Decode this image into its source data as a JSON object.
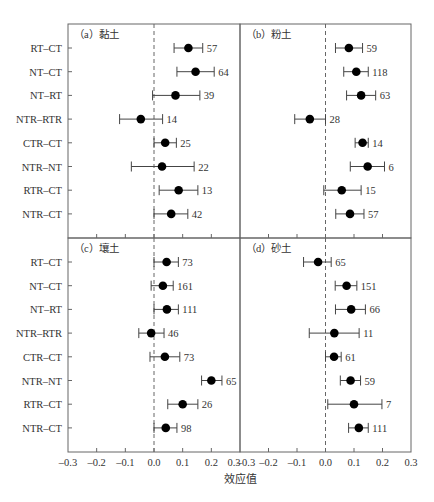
{
  "chart_data": {
    "type": "forest",
    "xlabel": "效应值",
    "xlim": [
      -0.3,
      0.3
    ],
    "xticks": [
      "-0.3",
      "-0.2",
      "-0.1",
      "0.0",
      "0.1",
      "0.2",
      "0.3"
    ],
    "reference_line": 0.0,
    "categories": [
      "RT-CT",
      "NT-CT",
      "NT-RT",
      "NTR-RTR",
      "CTR-CT",
      "NTR-NT",
      "RTR-CT",
      "NTR-CT"
    ],
    "panels": [
      {
        "id": "a",
        "title": "（a）黏土",
        "points": [
          {
            "label": "RT-CT",
            "mean": 0.12,
            "lo": 0.07,
            "hi": 0.17,
            "n": "57"
          },
          {
            "label": "NT-CT",
            "mean": 0.145,
            "lo": 0.08,
            "hi": 0.21,
            "n": "64"
          },
          {
            "label": "NT-RT",
            "mean": 0.075,
            "lo": -0.005,
            "hi": 0.16,
            "n": "39"
          },
          {
            "label": "NTR-RTR",
            "mean": -0.046,
            "lo": -0.12,
            "hi": 0.03,
            "n": "14"
          },
          {
            "label": "CTR-CT",
            "mean": 0.039,
            "lo": 0.0,
            "hi": 0.078,
            "n": "25"
          },
          {
            "label": "NTR-NT",
            "mean": 0.028,
            "lo": -0.079,
            "hi": 0.14,
            "n": "22"
          },
          {
            "label": "RTR-CT",
            "mean": 0.086,
            "lo": 0.018,
            "hi": 0.153,
            "n": "13"
          },
          {
            "label": "NTR-CT",
            "mean": 0.06,
            "lo": 0.0,
            "hi": 0.118,
            "n": "42"
          }
        ]
      },
      {
        "id": "b",
        "title": "（b）粉土",
        "points": [
          {
            "label": "RT-CT",
            "mean": 0.082,
            "lo": 0.035,
            "hi": 0.13,
            "n": "59"
          },
          {
            "label": "NT-CT",
            "mean": 0.108,
            "lo": 0.064,
            "hi": 0.15,
            "n": "118"
          },
          {
            "label": "NT-RT",
            "mean": 0.125,
            "lo": 0.074,
            "hi": 0.176,
            "n": "63"
          },
          {
            "label": "NTR-RTR",
            "mean": -0.055,
            "lo": -0.108,
            "hi": 0.0,
            "n": "28"
          },
          {
            "label": "CTR-CT",
            "mean": 0.13,
            "lo": 0.104,
            "hi": 0.15,
            "n": "14"
          },
          {
            "label": "NTR-NT",
            "mean": 0.148,
            "lo": 0.087,
            "hi": 0.207,
            "n": "6"
          },
          {
            "label": "RTR-CT",
            "mean": 0.057,
            "lo": -0.006,
            "hi": 0.125,
            "n": "15"
          },
          {
            "label": "NTR-CT",
            "mean": 0.086,
            "lo": 0.036,
            "hi": 0.135,
            "n": "57"
          }
        ]
      },
      {
        "id": "c",
        "title": "（c）壤土",
        "points": [
          {
            "label": "RT-CT",
            "mean": 0.044,
            "lo": 0.0,
            "hi": 0.085,
            "n": "73"
          },
          {
            "label": "NT-CT",
            "mean": 0.031,
            "lo": -0.01,
            "hi": 0.067,
            "n": "161"
          },
          {
            "label": "NT-RT",
            "mean": 0.045,
            "lo": 0.0,
            "hi": 0.085,
            "n": "111"
          },
          {
            "label": "NTR-RTR",
            "mean": -0.01,
            "lo": -0.053,
            "hi": 0.035,
            "n": "46"
          },
          {
            "label": "CTR-CT",
            "mean": 0.038,
            "lo": -0.014,
            "hi": 0.09,
            "n": "73"
          },
          {
            "label": "NTR-NT",
            "mean": 0.2,
            "lo": 0.166,
            "hi": 0.237,
            "n": "65"
          },
          {
            "label": "RTR-CT",
            "mean": 0.1,
            "lo": 0.048,
            "hi": 0.153,
            "n": "26"
          },
          {
            "label": "NTR-CT",
            "mean": 0.041,
            "lo": 0.0,
            "hi": 0.08,
            "n": "98"
          }
        ]
      },
      {
        "id": "d",
        "title": "（d）砂土",
        "points": [
          {
            "label": "RT-CT",
            "mean": -0.026,
            "lo": -0.077,
            "hi": 0.02,
            "n": "65"
          },
          {
            "label": "NT-CT",
            "mean": 0.074,
            "lo": 0.034,
            "hi": 0.11,
            "n": "151"
          },
          {
            "label": "NT-RT",
            "mean": 0.09,
            "lo": 0.035,
            "hi": 0.14,
            "n": "66"
          },
          {
            "label": "NTR-RTR",
            "mean": 0.031,
            "lo": -0.057,
            "hi": 0.118,
            "n": "11"
          },
          {
            "label": "CTR-CT",
            "mean": 0.03,
            "lo": 0.0,
            "hi": 0.055,
            "n": "61"
          },
          {
            "label": "NTR-NT",
            "mean": 0.088,
            "lo": 0.052,
            "hi": 0.123,
            "n": "59"
          },
          {
            "label": "RTR-CT",
            "mean": 0.1,
            "lo": 0.008,
            "hi": 0.198,
            "n": "7"
          },
          {
            "label": "NTR-CT",
            "mean": 0.117,
            "lo": 0.081,
            "hi": 0.15,
            "n": "111"
          }
        ]
      }
    ],
    "layout": {
      "panel_grid": "2x2",
      "shared_y_labels": "left column",
      "x_tick_labels": "bottom row only",
      "grid": false,
      "legend": "none"
    }
  },
  "style": {
    "axis_color": "#666666",
    "text_color": "#333333",
    "point_color": "#000000",
    "errorbar_color": "#444444",
    "reference_line_color": "#666666"
  }
}
